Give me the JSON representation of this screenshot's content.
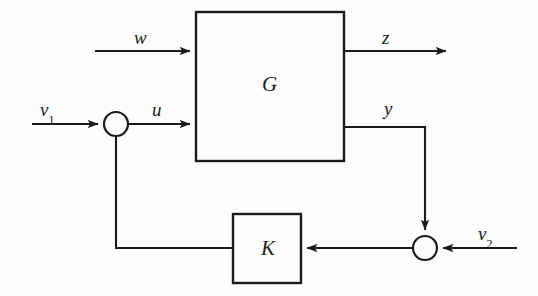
{
  "figure": {
    "kind": "control-system-block-diagram",
    "background_color": "#fdfdfd",
    "line_color": "#1a1a1a",
    "canvas": {
      "width": 538,
      "height": 296
    }
  },
  "blocks": [
    {
      "id": "plant",
      "label": "G",
      "x": 196,
      "y": 12,
      "width": 148,
      "height": 149
    },
    {
      "id": "controller",
      "label": "K",
      "x": 233,
      "y": 214,
      "width": 68,
      "height": 69
    }
  ],
  "junctions": [
    {
      "id": "sum-left",
      "name": "input-summing-junction",
      "cx": 116,
      "cy": 124,
      "r": 12
    },
    {
      "id": "sum-right",
      "name": "output-summing-junction",
      "cx": 425,
      "cy": 248,
      "r": 12
    }
  ],
  "signals": [
    {
      "id": "w",
      "label": "w",
      "sub": "",
      "x": 134,
      "y": 28,
      "name": "signal-label-w"
    },
    {
      "id": "z",
      "label": "z",
      "sub": "",
      "x": 382,
      "y": 28,
      "name": "signal-label-z"
    },
    {
      "id": "v1",
      "label": "v",
      "sub": "1",
      "x": 40,
      "y": 100,
      "name": "signal-label-v1"
    },
    {
      "id": "u",
      "label": "u",
      "sub": "",
      "x": 152,
      "y": 100,
      "name": "signal-label-u"
    },
    {
      "id": "y",
      "label": "y",
      "sub": "",
      "x": 384,
      "y": 99,
      "name": "signal-label-y"
    },
    {
      "id": "v2",
      "label": "v",
      "sub": "2",
      "x": 478,
      "y": 224,
      "name": "signal-label-v2"
    }
  ],
  "paths": {
    "w_in": {
      "from_x": 95,
      "from_y": 51,
      "to_x": 196,
      "to_y": 51
    },
    "z_out": {
      "from_x": 344,
      "from_y": 51,
      "to_x": 452,
      "to_y": 51
    },
    "v1_in": {
      "from_x": 32,
      "from_y": 124,
      "to_x": 104,
      "to_y": 124
    },
    "u_to_plant": {
      "from_x": 128,
      "from_y": 124,
      "to_x": 196,
      "to_y": 124
    },
    "y_out": {
      "from_x": 344,
      "from_y": 127,
      "to_x": 425,
      "to_y": 127
    },
    "y_down": {
      "from_x": 425,
      "from_y": 127,
      "to_x": 425,
      "to_y": 236
    },
    "v2_in": {
      "from_x": 517,
      "from_y": 248,
      "to_x": 437,
      "to_y": 248
    },
    "sum_to_k": {
      "from_x": 413,
      "from_y": 248,
      "to_x": 301,
      "to_y": 248
    },
    "k_to_feedback": {
      "from_x": 233,
      "from_y": 248,
      "to_x": 116,
      "to_y": 248
    },
    "feedback_up": {
      "from_x": 116,
      "from_y": 248,
      "to_x": 116,
      "to_y": 136
    }
  }
}
